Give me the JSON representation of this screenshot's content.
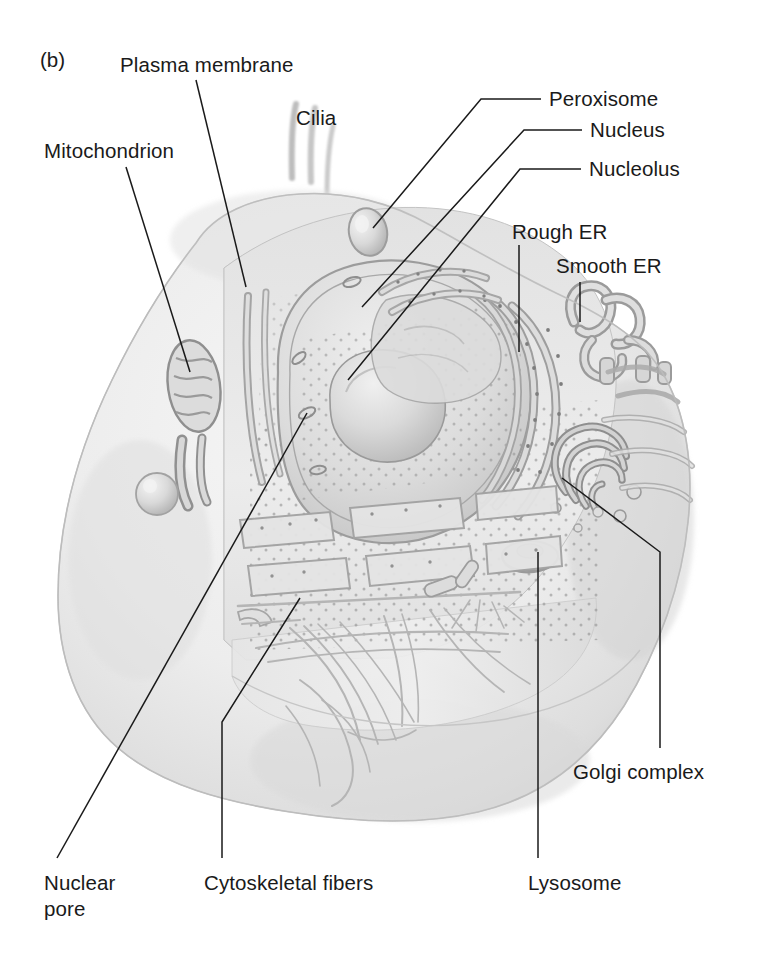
{
  "figure": {
    "panel_tag": "(b)",
    "style": "pencil-shaded scientific illustration, grayscale",
    "background_color": "#ffffff",
    "ink_color": "#1a1a1a",
    "cell_fill_color": "#e9e9e9",
    "cell_shade_color": "#c9c9c9"
  },
  "labels": {
    "plasma_membrane": "Plasma membrane",
    "cilia": "Cilia",
    "mitochondrion": "Mitochondrion",
    "peroxisome": "Peroxisome",
    "nucleus": "Nucleus",
    "nucleolus": "Nucleolus",
    "rough_er": "Rough ER",
    "smooth_er": "Smooth ER",
    "golgi_complex": "Golgi complex",
    "lysosome": "Lysosome",
    "cytoskeletal_fibers": "Cytoskeletal fibers",
    "nuclear_pore_line1": "Nuclear",
    "nuclear_pore_line2": "pore"
  },
  "callouts": [
    {
      "name": "plasma-membrane",
      "label": "Plasma membrane",
      "text_x": 120,
      "text_y": 56,
      "target_x": 246,
      "target_y": 287
    },
    {
      "name": "cilia",
      "label": "Cilia",
      "text_x": 296,
      "text_y": 108,
      "target_x": 318,
      "target_y": 170
    },
    {
      "name": "mitochondrion",
      "label": "Mitochondrion",
      "text_x": 44,
      "text_y": 141,
      "target_x": 190,
      "target_y": 372
    },
    {
      "name": "peroxisome",
      "label": "Peroxisome",
      "text_x": 548,
      "text_y": 88,
      "target_x": 373,
      "target_y": 228
    },
    {
      "name": "nucleus",
      "label": "Nucleus",
      "text_x": 589,
      "text_y": 118,
      "target_x": 362,
      "target_y": 307
    },
    {
      "name": "nucleolus",
      "label": "Nucleolus",
      "text_x": 588,
      "text_y": 157,
      "target_x": 348,
      "target_y": 380
    },
    {
      "name": "rough-er",
      "label": "Rough ER",
      "text_x": 512,
      "text_y": 220,
      "target_x": 519,
      "target_y": 352
    },
    {
      "name": "smooth-er",
      "label": "Smooth ER",
      "text_x": 556,
      "text_y": 254,
      "target_x": 580,
      "target_y": 320
    },
    {
      "name": "golgi-complex",
      "label": "Golgi complex",
      "text_x": 573,
      "text_y": 761,
      "target_x": 562,
      "target_y": 478
    },
    {
      "name": "lysosome",
      "label": "Lysosome",
      "text_x": 528,
      "text_y": 872,
      "target_x": 538,
      "target_y": 552
    },
    {
      "name": "cytoskeletal-fibers",
      "label": "Cytoskeletal fibers",
      "text_x": 204,
      "text_y": 872,
      "target_x": 300,
      "target_y": 598
    },
    {
      "name": "nuclear-pore",
      "label": "Nuclear pore",
      "text_x": 44,
      "text_y": 872,
      "target_x": 307,
      "target_y": 413
    }
  ],
  "organelles": [
    "plasma membrane",
    "cilia",
    "mitochondrion",
    "peroxisome",
    "nucleus",
    "nucleolus",
    "nuclear pore",
    "rough endoplasmic reticulum",
    "smooth endoplasmic reticulum",
    "golgi complex",
    "lysosome",
    "cytoskeletal fibers"
  ]
}
